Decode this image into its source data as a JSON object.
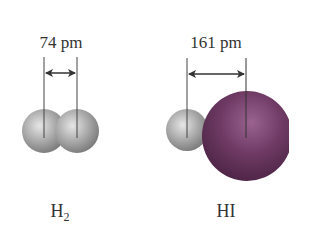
{
  "molecules": [
    {
      "name": "H",
      "subscript": "2",
      "bond_length_label": "74 pm",
      "atoms": [
        {
          "element": "H",
          "color": "#a8a8a8"
        },
        {
          "element": "H",
          "color": "#a8a8a8"
        }
      ]
    },
    {
      "name": "HI",
      "subscript": "",
      "bond_length_label": "161 pm",
      "atoms": [
        {
          "element": "H",
          "color": "#b0b0b0"
        },
        {
          "element": "I",
          "color": "#6e3a64"
        }
      ]
    }
  ],
  "colors": {
    "hydrogen": "#a8a8a8",
    "iodine": "#6e3a64",
    "lines": "#444444"
  }
}
